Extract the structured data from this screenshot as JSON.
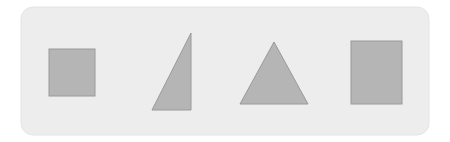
{
  "page": {
    "width": 450,
    "height": 142,
    "background_color": "#ffffff"
  },
  "panel": {
    "name": "shapes-panel",
    "x": 21,
    "y": 7,
    "width": 408,
    "height": 128,
    "corner_radius": 12,
    "fill_color": "#ededed",
    "stroke_color": "#e4e4e4"
  },
  "style": {
    "shape_fill_color": "#b5b5b5",
    "shape_stroke_color": "#9a9a9a",
    "shape_stroke_width": 1
  },
  "shapes": [
    {
      "id": "square",
      "label": "Square",
      "type": "rect",
      "x": 49,
      "y": 49,
      "width": 46,
      "height": 47,
      "fill": "#b5b5b5",
      "stroke": "#9a9a9a"
    },
    {
      "id": "right-triangle",
      "label": "Right Triangle",
      "type": "polygon",
      "points": "152,110 191,110 191,33",
      "fill": "#b5b5b5",
      "stroke": "#9a9a9a"
    },
    {
      "id": "equilateral-triangle",
      "label": "Equilateral Triangle",
      "type": "polygon",
      "points": "240,104 308,104 274,42",
      "fill": "#b5b5b5",
      "stroke": "#9a9a9a"
    },
    {
      "id": "rectangle",
      "label": "Rectangle",
      "type": "rect",
      "x": 351,
      "y": 41,
      "width": 51,
      "height": 63,
      "fill": "#b5b5b5",
      "stroke": "#9a9a9a"
    }
  ]
}
